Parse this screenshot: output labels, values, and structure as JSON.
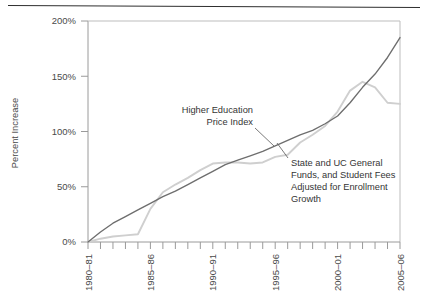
{
  "figure": {
    "top_rule": "horizontal-rule"
  },
  "chart_data": {
    "type": "line",
    "title": "",
    "xlabel": "",
    "ylabel": "Percent Increase",
    "ylim": [
      0,
      200
    ],
    "ytick_labels": [
      "0%",
      "50%",
      "100%",
      "150%",
      "200%"
    ],
    "ytick_values": [
      0,
      50,
      100,
      150,
      200
    ],
    "grid": false,
    "legend_position": "inline-annotations",
    "x_axis_ticks_count": 26,
    "xtick_labels": [
      "1980–81",
      "1985–86",
      "1990–91",
      "1995–96",
      "2000–01",
      "2005–06"
    ],
    "xtick_label_indices": [
      0,
      5,
      10,
      15,
      20,
      25
    ],
    "x": [
      "1980–81",
      "1981–82",
      "1982–83",
      "1983–84",
      "1984–85",
      "1985–86",
      "1986–87",
      "1987–88",
      "1988–89",
      "1989–90",
      "1990–91",
      "1991–92",
      "1992–93",
      "1993–94",
      "1994–95",
      "1995–96",
      "1996–97",
      "1997–98",
      "1998–99",
      "1999–00",
      "2000–01",
      "2001–02",
      "2002–03",
      "2003–04",
      "2004–05",
      "2005–06"
    ],
    "series": [
      {
        "name": "Higher Education Price Index",
        "color": "#6e6e6e",
        "values": [
          0,
          9,
          17,
          23,
          29,
          35,
          41,
          46,
          52,
          58,
          64,
          70,
          74,
          78,
          82,
          87,
          92,
          97,
          101,
          107,
          114,
          126,
          140,
          152,
          167,
          185
        ]
      },
      {
        "name": "State and UC General Funds, and Student Fees Adjusted for Enrollment Growth",
        "color": "#cfcfcf",
        "values": [
          0,
          3,
          5,
          6,
          7,
          30,
          45,
          52,
          58,
          65,
          71,
          72,
          72,
          71,
          72,
          77,
          79,
          90,
          97,
          105,
          118,
          137,
          145,
          140,
          126,
          125
        ]
      }
    ],
    "annotations": [
      {
        "name": "hepi-annotation",
        "lines": [
          "Higher Education",
          "Price Index"
        ],
        "align": "right"
      },
      {
        "name": "state-funds-annotation",
        "lines": [
          "State and UC General",
          "Funds, and Student Fees",
          "Adjusted for Enrollment",
          "Growth"
        ],
        "align": "left"
      }
    ]
  }
}
